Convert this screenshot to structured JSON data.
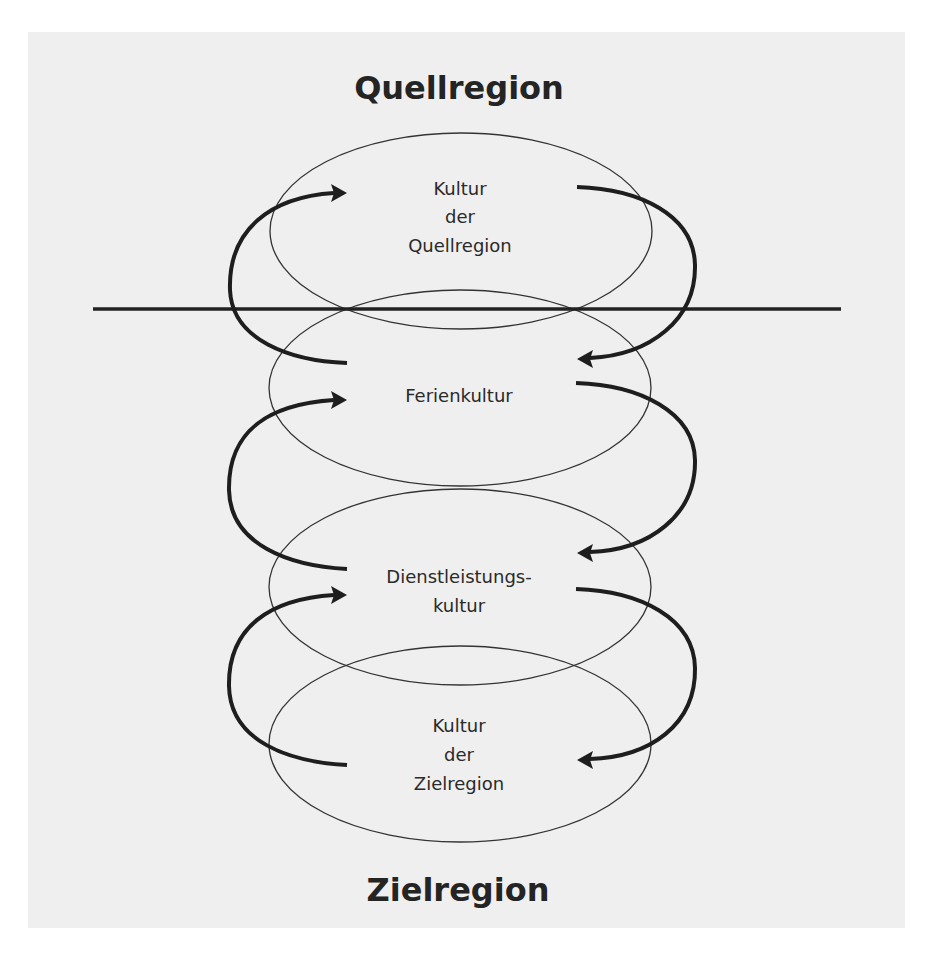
{
  "diagram": {
    "titles": {
      "top": "Quellregion",
      "bottom": "Zielregion"
    },
    "layers": [
      {
        "id": "source-culture",
        "lines": [
          "Kultur",
          "der",
          "Quellregion"
        ]
      },
      {
        "id": "holiday-culture",
        "lines": [
          "Ferienkultur"
        ]
      },
      {
        "id": "service-culture",
        "lines": [
          "Dienstleistungs-",
          "kultur"
        ]
      },
      {
        "id": "destination-culture",
        "lines": [
          "Kultur",
          "der",
          "Zielregion"
        ]
      }
    ],
    "colors": {
      "panel_background": "#efefef",
      "page_background": "#ffffff",
      "stroke": "#222222",
      "text": "#2a2a2a"
    },
    "divider": "horizontal line separating Quellregion (above) from Zielregion (below)",
    "flows": [
      {
        "side": "left",
        "from": "Ferienkultur",
        "to": "Kultur der Quellregion"
      },
      {
        "side": "right",
        "from": "Kultur der Quellregion",
        "to": "Ferienkultur"
      },
      {
        "side": "left",
        "from": "Dienstleistungskultur",
        "to": "Ferienkultur"
      },
      {
        "side": "right",
        "from": "Ferienkultur",
        "to": "Dienstleistungskultur"
      },
      {
        "side": "left",
        "from": "Kultur der Zielregion",
        "to": "Dienstleistungskultur"
      },
      {
        "side": "right",
        "from": "Dienstleistungskultur",
        "to": "Kultur der Zielregion"
      }
    ]
  }
}
